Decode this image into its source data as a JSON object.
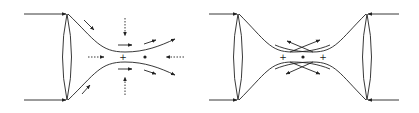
{
  "diagrams": [
    {
      "name": "single-beam-trap",
      "labels": {
        "plus": "+",
        "dot": "•"
      }
    },
    {
      "name": "dual-beam-trap",
      "labels": {
        "plus_left": "+",
        "plus_right": "+",
        "dot": "•"
      }
    }
  ],
  "colors": {
    "stroke": "#222222",
    "background": "#ffffff"
  }
}
